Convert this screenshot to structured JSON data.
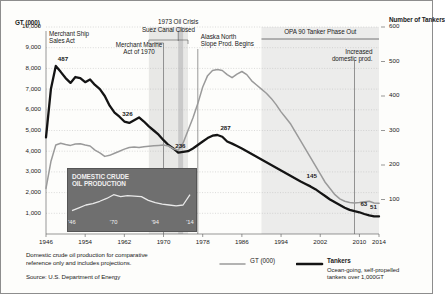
{
  "chart_data": {
    "type": "line",
    "title": "",
    "xlabel": "",
    "ylabel": "GT (000)",
    "y2label": "Number of Tankers",
    "xlim": [
      1946,
      2014
    ],
    "ylim": [
      0,
      10000
    ],
    "y2lim": [
      0,
      600
    ],
    "grid": true,
    "legend_position": "bottom",
    "x_ticks": [
      "1946",
      "1954",
      "1962",
      "1970",
      "1978",
      "1986",
      "1994",
      "2002",
      "2010",
      "2014"
    ],
    "x_tick_values": [
      1946,
      1954,
      1962,
      1970,
      1978,
      1986,
      1994,
      2002,
      2010,
      2014
    ],
    "y_ticks": [
      "1,000",
      "2,000",
      "3,000",
      "4,000",
      "5,000",
      "6,000",
      "7,000",
      "8,000",
      "9,000",
      "10,000"
    ],
    "y_tick_values": [
      1000,
      2000,
      3000,
      4000,
      5000,
      6000,
      7000,
      8000,
      9000,
      10000
    ],
    "y2_ticks": [
      "100",
      "200",
      "300",
      "400",
      "500",
      "600"
    ],
    "y2_tick_values": [
      100,
      200,
      300,
      400,
      500,
      600
    ],
    "series": [
      {
        "name": "Tankers",
        "axis": "right",
        "color": "#141414",
        "x": [
          1946,
          1947,
          1948,
          1949,
          1950,
          1951,
          1952,
          1953,
          1954,
          1955,
          1956,
          1957,
          1958,
          1959,
          1960,
          1961,
          1962,
          1963,
          1964,
          1965,
          1966,
          1967,
          1968,
          1969,
          1970,
          1971,
          1972,
          1973,
          1974,
          1975,
          1976,
          1977,
          1978,
          1979,
          1980,
          1981,
          1982,
          1983,
          1984,
          1985,
          1986,
          1987,
          1988,
          1989,
          1990,
          1991,
          1992,
          1993,
          1994,
          1995,
          1996,
          1997,
          1998,
          1999,
          2000,
          2001,
          2002,
          2003,
          2004,
          2005,
          2006,
          2007,
          2008,
          2009,
          2010,
          2011,
          2012,
          2013,
          2014
        ],
        "values": [
          280,
          420,
          487,
          470,
          452,
          438,
          455,
          452,
          440,
          448,
          432,
          420,
          400,
          372,
          352,
          340,
          326,
          322,
          330,
          338,
          326,
          312,
          300,
          288,
          272,
          258,
          248,
          236,
          238,
          240,
          248,
          258,
          268,
          278,
          285,
          287,
          282,
          268,
          262,
          255,
          248,
          240,
          232,
          224,
          216,
          208,
          200,
          192,
          184,
          176,
          168,
          160,
          152,
          145,
          138,
          130,
          120,
          110,
          100,
          92,
          84,
          76,
          70,
          66,
          63,
          58,
          54,
          51,
          51
        ]
      },
      {
        "name": "GT (000)",
        "axis": "left",
        "color": "#9a9a9a",
        "x": [
          1946,
          1947,
          1948,
          1949,
          1950,
          1951,
          1952,
          1953,
          1954,
          1955,
          1956,
          1957,
          1958,
          1959,
          1960,
          1961,
          1962,
          1963,
          1964,
          1965,
          1966,
          1967,
          1968,
          1969,
          1970,
          1971,
          1972,
          1973,
          1974,
          1975,
          1976,
          1977,
          1978,
          1979,
          1980,
          1981,
          1982,
          1983,
          1984,
          1985,
          1986,
          1987,
          1988,
          1989,
          1990,
          1991,
          1992,
          1993,
          1994,
          1995,
          1996,
          1997,
          1998,
          1999,
          2000,
          2001,
          2002,
          2003,
          2004,
          2005,
          2006,
          2007,
          2008,
          2009,
          2010,
          2011,
          2012,
          2013,
          2014
        ],
        "values": [
          2200,
          3500,
          4300,
          4380,
          4320,
          4280,
          4350,
          4360,
          4300,
          4250,
          4050,
          3920,
          3750,
          3800,
          3900,
          4000,
          4100,
          4180,
          4200,
          4180,
          4220,
          4240,
          4260,
          4280,
          4300,
          4250,
          4120,
          4050,
          4400,
          5000,
          5600,
          6300,
          7100,
          7650,
          7900,
          7950,
          7900,
          7700,
          7550,
          7720,
          7850,
          7700,
          7400,
          7200,
          7000,
          6800,
          6550,
          6250,
          5900,
          5600,
          5300,
          4900,
          4500,
          4100,
          3700,
          3300,
          2900,
          2500,
          2200,
          1900,
          1700,
          1580,
          1520,
          1500,
          1520,
          1560,
          1580,
          1500,
          1480
        ]
      }
    ],
    "data_labels": [
      {
        "text": "487",
        "series": "Tankers",
        "x": 1948,
        "value": 487
      },
      {
        "text": "326",
        "series": "Tankers",
        "x": 1962,
        "value": 326
      },
      {
        "text": "236",
        "series": "Tankers",
        "x": 1973,
        "value": 236
      },
      {
        "text": "287",
        "series": "Tankers",
        "x": 1981,
        "value": 287
      },
      {
        "text": "145",
        "series": "Tankers",
        "x": 1999,
        "value": 145
      },
      {
        "text": "63",
        "series": "Tankers",
        "x": 2010,
        "value": 63
      },
      {
        "text": "51",
        "series": "Tankers",
        "x": 2014,
        "value": 51
      }
    ],
    "annotations": [
      {
        "name": "merchant-ship-sales-act",
        "text": "Merchant Ship\nSales Act",
        "year": 1946
      },
      {
        "name": "merchant-marine-act",
        "text": "Merchant Marine\nAct of 1970",
        "year": 1970
      },
      {
        "name": "suez-canal-closed",
        "text": "Suez Canal Closed",
        "year_start": 1967,
        "year_end": 1975
      },
      {
        "name": "oil-crisis",
        "text": "1973 Oil Crisis",
        "year": 1973
      },
      {
        "name": "alaska-north-slope",
        "text": "Alaska North\nSlope Prod. Begins",
        "year": 1977
      },
      {
        "name": "opa-90-phase-out",
        "text": "OPA 90 Tanker Phase Out",
        "year_start": 1990,
        "year_end": 2014
      },
      {
        "name": "increased-domestic-prod",
        "text": "Increased\ndomestic prod.",
        "year": 2009
      }
    ],
    "shaded_bands": [
      {
        "name": "suez-canal-band",
        "year_start": 1967,
        "year_end": 1975,
        "color": "#e8e8e6"
      },
      {
        "name": "oil-crisis-band",
        "year_start": 1973,
        "year_end": 1974,
        "color": "#c9c9c9"
      },
      {
        "name": "opa-90-band",
        "year_start": 1990,
        "year_end": 2014,
        "color": "#ececeb"
      }
    ],
    "inset": {
      "title": "DOMESTIC CRUDE\nOIL PRODUCTION",
      "x_ticks": [
        "'46",
        "'70",
        "'94",
        "'14"
      ],
      "x": [
        1946,
        1950,
        1954,
        1958,
        1962,
        1966,
        1970,
        1974,
        1978,
        1982,
        1986,
        1990,
        1994,
        1998,
        2002,
        2006,
        2010,
        2014
      ],
      "values": [
        18,
        24,
        30,
        33,
        38,
        44,
        52,
        48,
        50,
        49,
        48,
        40,
        35,
        32,
        30,
        28,
        30,
        52
      ]
    }
  },
  "legend": {
    "items": [
      {
        "name": "legend-gt",
        "label": "GT (000)",
        "sub": "",
        "color": "#9a9a9a",
        "weight": "normal"
      },
      {
        "name": "legend-tankers",
        "label": "Tankers",
        "sub": "Ocean-going, self-propelled\ntankers over 1,000GT",
        "color": "#141414",
        "weight": "bold"
      }
    ]
  },
  "footnote": {
    "note": "Domestic crude oil production for comparative\nreference only and includes projections.",
    "source": "Source: U.S. Department of Energy"
  }
}
